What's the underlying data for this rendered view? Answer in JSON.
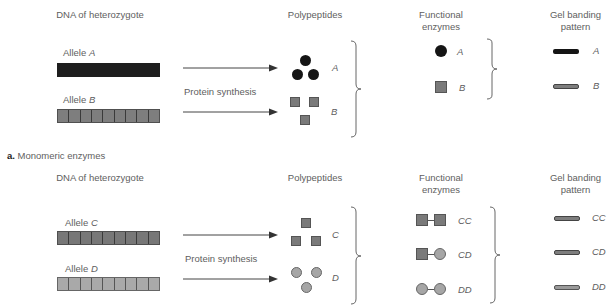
{
  "panel_a": {
    "headers": {
      "dna": "DNA of heterozygote",
      "polypeptides": "Polypeptides",
      "functional": "Functional enzymes",
      "gel": "Gel banding pattern"
    },
    "alleles": [
      {
        "prefix": "Allele",
        "name": "A"
      },
      {
        "prefix": "Allele",
        "name": "B"
      }
    ],
    "process": "Protein synthesis",
    "polypeptide_labels": [
      "A",
      "B"
    ],
    "enzyme_labels": [
      "A",
      "B"
    ],
    "band_labels": [
      "A",
      "B"
    ],
    "caption_letter": "a.",
    "caption_text": "Monomeric enzymes"
  },
  "panel_b": {
    "headers": {
      "dna": "DNA of heterozygote",
      "polypeptides": "Polypeptides",
      "functional": "Functional enzymes",
      "gel": "Gel banding pattern"
    },
    "alleles": [
      {
        "prefix": "Allele",
        "name": "C"
      },
      {
        "prefix": "Allele",
        "name": "D"
      }
    ],
    "process": "Protein synthesis",
    "polypeptide_labels": [
      "C",
      "D"
    ],
    "enzyme_labels": [
      "CC",
      "CD",
      "DD"
    ],
    "band_labels": [
      "CC",
      "CD",
      "DD"
    ]
  },
  "colors": {
    "allele_A": "#1e1e1e",
    "allele_B": "#7e7e7e",
    "allele_C": "#777777",
    "allele_D": "#a9a9a9"
  }
}
